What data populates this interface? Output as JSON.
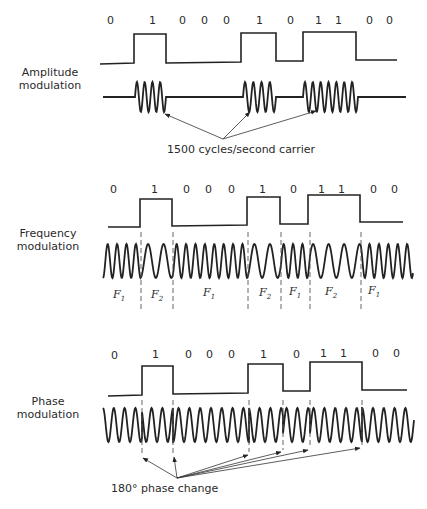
{
  "bits": [
    "0",
    "1",
    "0",
    "0",
    "0",
    "1",
    "0",
    "1",
    "1",
    "0",
    "0"
  ],
  "panels": {
    "am": {
      "label_line1": "Amplitude",
      "label_line2": "modulation",
      "annotation": "1500 cycles/second carrier"
    },
    "fm": {
      "label_line1": "Frequency",
      "label_line2": "modulation",
      "segments": [
        {
          "name": "F",
          "sub": "1"
        },
        {
          "name": "F",
          "sub": "2"
        },
        {
          "name": "F",
          "sub": "1"
        },
        {
          "name": "F",
          "sub": "2"
        },
        {
          "name": "F",
          "sub": "1"
        },
        {
          "name": "F",
          "sub": "2"
        },
        {
          "name": "F",
          "sub": "1"
        }
      ]
    },
    "pm": {
      "label_line1": "Phase",
      "label_line2": "modulation",
      "annotation": "180° phase change"
    }
  },
  "colors": {
    "ink": "#222222",
    "background": "#ffffff"
  }
}
